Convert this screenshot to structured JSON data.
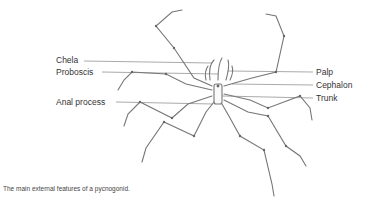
{
  "labels": {
    "chela": "Chela",
    "proboscis": "Proboscis",
    "anal_process": "Anal process",
    "palp": "Palp",
    "cephalon": "Cephalon",
    "trunk": "Trunk"
  },
  "caption": "The main external features of a pycnogonid."
}
